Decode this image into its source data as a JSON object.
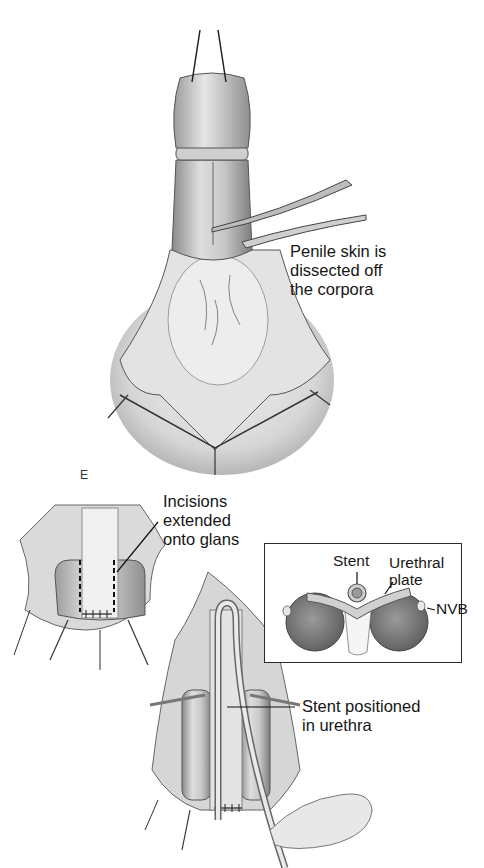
{
  "figure": {
    "panel_letter": "E",
    "top_illustration": {
      "label": "Penile skin is\ndissected off\nthe corpora"
    },
    "bottom_left_illustration": {
      "label": "Incisions\nextended\nonto glans"
    },
    "bottom_right_illustration": {
      "label": "Stent positioned\nin urethra"
    },
    "inset": {
      "labels": {
        "stent": "Stent",
        "urethral_plate": "Urethral\nplate",
        "nvb": "NVB"
      }
    }
  }
}
